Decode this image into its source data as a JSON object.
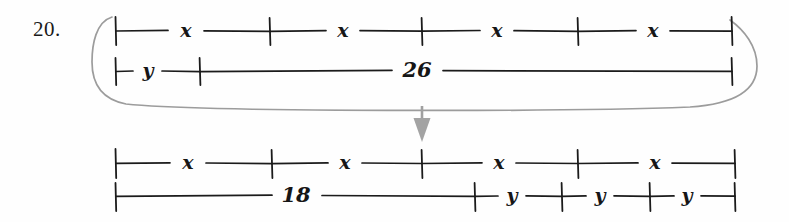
{
  "problem": {
    "number": "20."
  },
  "colors": {
    "ink": "#161616",
    "annotation": "#9a9a9a",
    "paper": "#fefefe"
  },
  "diagram": {
    "type": "tape-diagram-equation",
    "top_model": {
      "name": "original-equation-model",
      "upper_bar": {
        "name": "x-bar-top",
        "segments": [
          {
            "label": "x"
          },
          {
            "label": "x"
          },
          {
            "label": "x"
          },
          {
            "label": "x"
          }
        ],
        "tick_positions": [
          115,
          270,
          422,
          578,
          732
        ]
      },
      "lower_bar": {
        "name": "y-plus-26-bar",
        "segments": [
          {
            "label": "y"
          },
          {
            "label": "26"
          }
        ],
        "tick_positions": [
          115,
          200,
          732
        ]
      }
    },
    "transform_arrow": {
      "name": "transform-arrow",
      "direction": "down",
      "x": 422,
      "y_start": 106,
      "y_end": 142
    },
    "highlight_oval": {
      "name": "grouping-oval",
      "shape": "rounded-enclosure"
    },
    "bottom_model": {
      "name": "transformed-equation-model",
      "upper_bar": {
        "name": "x-bar-bottom",
        "segments": [
          {
            "label": "x"
          },
          {
            "label": "x"
          },
          {
            "label": "x"
          },
          {
            "label": "x"
          }
        ],
        "tick_positions": [
          115,
          272,
          422,
          578,
          735
        ]
      },
      "lower_bar": {
        "name": "18-plus-3y-bar",
        "segments": [
          {
            "label": "18"
          },
          {
            "label": "y"
          },
          {
            "label": "y"
          },
          {
            "label": "y"
          }
        ],
        "tick_positions": [
          115,
          475,
          562,
          650,
          735
        ]
      }
    }
  }
}
